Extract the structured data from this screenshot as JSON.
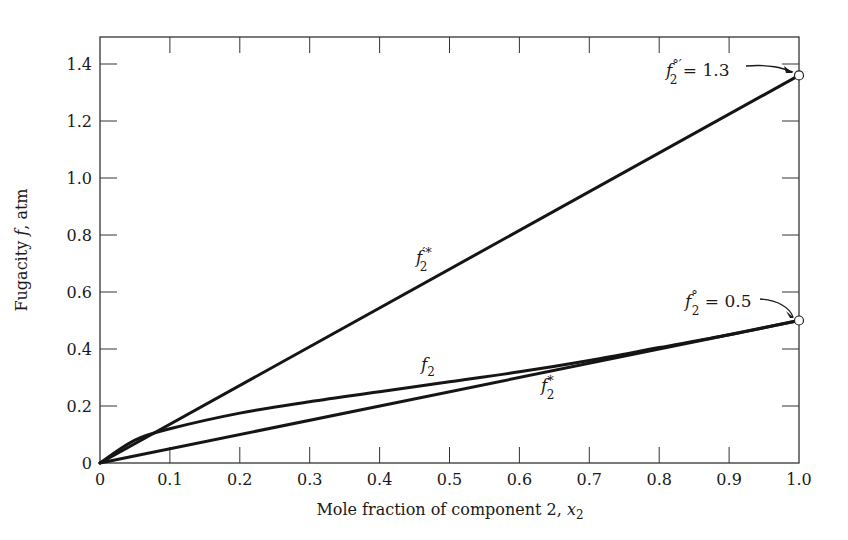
{
  "chart_data": {
    "type": "line",
    "title": "",
    "xlabel": "Mole fraction of component 2, x2",
    "ylabel": "Fugacity f, atm",
    "xlim": [
      0,
      1.0
    ],
    "ylim": [
      0,
      1.5
    ],
    "grid": false,
    "legend": "none (curves labeled inline)",
    "x_ticks": [
      "0",
      "0.1",
      "0.2",
      "0.3",
      "0.4",
      "0.5",
      "0.6",
      "0.7",
      "0.8",
      "0.9",
      "1.0"
    ],
    "y_ticks": [
      "0",
      "0.2",
      "0.4",
      "0.6",
      "0.8",
      "1.0",
      "1.2",
      "1.4"
    ],
    "series": [
      {
        "name": "f'*2",
        "label_parts": {
          "base": "f",
          "sup": "'*",
          "sub": "2"
        },
        "x": [
          0,
          1.0
        ],
        "y": [
          0,
          1.36
        ]
      },
      {
        "name": "f2",
        "label_parts": {
          "base": "f",
          "sup": "",
          "sub": "2"
        },
        "x": [
          0,
          0.05,
          0.1,
          0.2,
          0.3,
          0.4,
          0.5,
          0.6,
          0.7,
          0.8,
          0.9,
          1.0
        ],
        "y": [
          0,
          0.08,
          0.12,
          0.175,
          0.215,
          0.25,
          0.285,
          0.32,
          0.36,
          0.405,
          0.45,
          0.5
        ]
      },
      {
        "name": "f*2",
        "label_parts": {
          "base": "f",
          "sup": "*",
          "sub": "2"
        },
        "x": [
          0,
          1.0
        ],
        "y": [
          0,
          0.5
        ]
      }
    ],
    "annotations": [
      {
        "text": "f°'2 = 1.3",
        "base": "f",
        "sup": "°'",
        "sub": "2",
        "value_text": "= 1.3",
        "point": [
          1.0,
          1.36
        ]
      },
      {
        "text": "f°2 = 0.5",
        "base": "f",
        "sup": "°",
        "sub": "2",
        "value_text": "= 0.5",
        "point": [
          1.0,
          0.5
        ]
      }
    ]
  },
  "labels": {
    "ylabel_main": "Fugacity ",
    "ylabel_italic": "f",
    "ylabel_tail": ", atm",
    "xlabel_main": "Mole fraction of component 2, ",
    "xlabel_italic": "x",
    "xlabel_sub": "2",
    "f": "f",
    "sub2": "2",
    "sup_prime_star": "′*",
    "sup_star": "*",
    "sup_deg_prime": "°′",
    "sup_deg": "°",
    "eq_13": " = 1.3",
    "eq_05": " = 0.5"
  }
}
